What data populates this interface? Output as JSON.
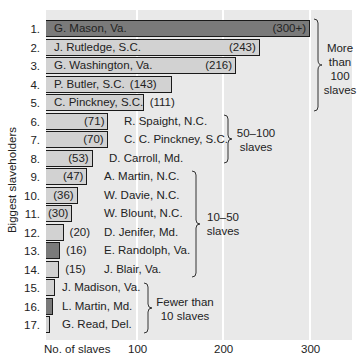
{
  "chart_data": {
    "type": "bar",
    "orientation": "horizontal",
    "title": "",
    "xlabel": "No. of slaves",
    "ylabel": "Biggest slaveholders",
    "xlim": [
      0,
      340
    ],
    "xticks": [
      100,
      200,
      300
    ],
    "grid": true,
    "categories": [
      "G. Mason, Va.",
      "J. Rutledge, S.C.",
      "G. Washington, Va.",
      "P. Butler, S.C.",
      "C. Pinckney, S.C.",
      "R. Spaight, N.C.",
      "C. C. Pinckney, S.C.",
      "D. Carroll, Md.",
      "A. Martin, N.C.",
      "W. Davie, N.C.",
      "W. Blount, N.C.",
      "D. Jenifer, Md.",
      "E. Randolph, Va.",
      "J. Blair, Va.",
      "J. Madison, Va.",
      "L. Martin, Md.",
      "G. Read, Del."
    ],
    "values": [
      300,
      243,
      216,
      143,
      111,
      71,
      70,
      53,
      47,
      36,
      30,
      20,
      16,
      15,
      10,
      8,
      3
    ],
    "value_labels": [
      "(300+)",
      "(243)",
      "(216)",
      "(143)",
      "(111)",
      "(71)",
      "(70)",
      "(53)",
      "(47)",
      "(36)",
      "(30)",
      "(20)",
      "(16)",
      "(15)",
      "",
      "",
      ""
    ],
    "groups": [
      {
        "label": "More than 100 slaves",
        "rows": [
          1,
          5
        ]
      },
      {
        "label": "50–100 slaves",
        "rows": [
          6,
          8
        ]
      },
      {
        "label": "10–50 slaves",
        "rows": [
          9,
          14
        ]
      },
      {
        "label": "Fewer than 10 slaves",
        "rows": [
          15,
          17
        ]
      }
    ]
  },
  "rows": [
    {
      "num": "1.",
      "name": "G. Mason, Va.",
      "val": "(300+)",
      "v": 300,
      "dark": true
    },
    {
      "num": "2.",
      "name": "J. Rutledge, S.C.",
      "val": "(243)",
      "v": 243,
      "dark": false
    },
    {
      "num": "3.",
      "name": "G. Washington, Va.",
      "val": "(216)",
      "v": 216,
      "dark": false
    },
    {
      "num": "4.",
      "name": "P. Butler, S.C.",
      "val": "(143)",
      "v": 143,
      "dark": false
    },
    {
      "num": "5.",
      "name": "C. Pinckney, S.C.",
      "val": "(111)",
      "v": 111,
      "dark": false
    },
    {
      "num": "6.",
      "name": "R. Spaight, N.C.",
      "val": "(71)",
      "v": 71,
      "dark": false
    },
    {
      "num": "7.",
      "name": "C. C. Pinckney, S.C.",
      "val": "(70)",
      "v": 70,
      "dark": false
    },
    {
      "num": "8.",
      "name": "D. Carroll, Md.",
      "val": "(53)",
      "v": 53,
      "dark": false
    },
    {
      "num": "9.",
      "name": "A. Martin, N.C.",
      "val": "(47)",
      "v": 47,
      "dark": false
    },
    {
      "num": "10.",
      "name": "W. Davie, N.C.",
      "val": "(36)",
      "v": 36,
      "dark": false
    },
    {
      "num": "11.",
      "name": "W. Blount, N.C.",
      "val": "(30)",
      "v": 30,
      "dark": false
    },
    {
      "num": "12.",
      "name": "D. Jenifer, Md.",
      "val": "(20)",
      "v": 20,
      "dark": false
    },
    {
      "num": "13.",
      "name": "E. Randolph, Va.",
      "val": "(16)",
      "v": 16,
      "dark": true
    },
    {
      "num": "14.",
      "name": "J. Blair, Va.",
      "val": "(15)",
      "v": 15,
      "dark": false
    },
    {
      "num": "15.",
      "name": "J. Madison, Va.",
      "val": "",
      "v": 10,
      "dark": false
    },
    {
      "num": "16.",
      "name": "L. Martin, Md.",
      "val": "",
      "v": 8,
      "dark": true
    },
    {
      "num": "17.",
      "name": "G. Read, Del.",
      "val": "",
      "v": 3,
      "dark": false
    }
  ],
  "axis": {
    "xlabel": "No. of slaves",
    "ylabel": "Biggest slaveholders",
    "ticks": [
      "100",
      "200",
      "300"
    ]
  },
  "groups": {
    "g1": {
      "line1": "More",
      "line2": "than",
      "line3": "100",
      "line4": "slaves"
    },
    "g2": {
      "line1": "50–100",
      "line2": "slaves"
    },
    "g3": {
      "line1": "10–50",
      "line2": "slaves"
    },
    "g4": {
      "line1": "Fewer than",
      "line2": "10 slaves"
    }
  },
  "colors": {
    "panel": "#e9e9e9",
    "bar_light": "#d2d2d2",
    "bar_dark": "#7a7a7a",
    "grid": "#ffffff",
    "outline": "#1a1a1a"
  }
}
